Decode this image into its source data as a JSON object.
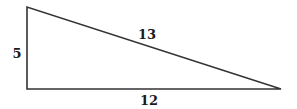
{
  "diagram": {
    "type": "right-triangle",
    "vertices": {
      "top_left": [
        27,
        7
      ],
      "bottom_left": [
        27,
        89
      ],
      "bottom_right": [
        281,
        89
      ]
    },
    "labels": {
      "vertical_side": "5",
      "hypotenuse": "13",
      "base": "12"
    },
    "stroke_color": "#333333"
  }
}
